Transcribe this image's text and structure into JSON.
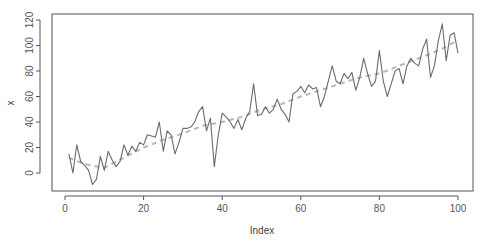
{
  "chart_data": {
    "type": "line",
    "title": "",
    "xlabel": "Index",
    "ylabel": "x",
    "xlim": [
      1,
      100
    ],
    "ylim": [
      -10,
      120
    ],
    "x_ticks": [
      0,
      20,
      40,
      60,
      80,
      100
    ],
    "y_ticks": [
      0,
      20,
      40,
      60,
      80,
      100,
      120
    ],
    "grid": false,
    "legend": null,
    "series": [
      {
        "name": "x",
        "style": "solid",
        "color": "#6b6b6b",
        "x": [
          1,
          2,
          3,
          4,
          5,
          6,
          7,
          8,
          9,
          10,
          11,
          12,
          13,
          14,
          15,
          16,
          17,
          18,
          19,
          20,
          21,
          22,
          23,
          24,
          25,
          26,
          27,
          28,
          29,
          30,
          31,
          32,
          33,
          34,
          35,
          36,
          37,
          38,
          39,
          40,
          41,
          42,
          43,
          44,
          45,
          46,
          47,
          48,
          49,
          50,
          51,
          52,
          53,
          54,
          55,
          56,
          57,
          58,
          59,
          60,
          61,
          62,
          63,
          64,
          65,
          66,
          67,
          68,
          69,
          70,
          71,
          72,
          73,
          74,
          75,
          76,
          77,
          78,
          79,
          80,
          81,
          82,
          83,
          84,
          85,
          86,
          87,
          88,
          89,
          90,
          91,
          92,
          93,
          94,
          95,
          96,
          97,
          98,
          99,
          100
        ],
        "values": [
          15,
          0,
          22,
          9,
          6,
          2,
          -9,
          -5,
          13,
          2,
          17,
          10,
          5,
          9,
          22,
          14,
          21,
          17,
          24,
          22,
          30,
          29,
          28,
          40,
          17,
          33,
          30,
          15,
          24,
          35,
          35,
          36,
          40,
          48,
          52,
          33,
          43,
          5,
          30,
          47,
          44,
          40,
          35,
          42,
          34,
          43,
          48,
          70,
          45,
          46,
          52,
          47,
          50,
          58,
          50,
          46,
          40,
          62,
          64,
          68,
          63,
          69,
          66,
          67,
          52,
          60,
          72,
          84,
          72,
          70,
          78,
          74,
          79,
          65,
          75,
          90,
          78,
          68,
          72,
          96,
          72,
          60,
          70,
          80,
          82,
          70,
          84,
          90,
          86,
          84,
          97,
          105,
          75,
          84,
          104,
          117,
          88,
          108,
          110,
          94
        ]
      },
      {
        "name": "smoothed",
        "style": "dashed",
        "color": "#b8b8b8",
        "x": [
          1,
          5,
          10,
          15,
          20,
          25,
          30,
          35,
          40,
          45,
          50,
          55,
          60,
          65,
          70,
          75,
          80,
          85,
          90,
          95,
          100
        ],
        "values": [
          12,
          7,
          4,
          12,
          20,
          26,
          31,
          37,
          40,
          44,
          50,
          54,
          60,
          65,
          70,
          75,
          78,
          84,
          90,
          96,
          104
        ]
      }
    ]
  }
}
